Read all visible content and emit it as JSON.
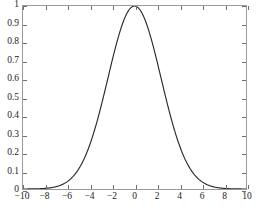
{
  "figure": {
    "caption": "",
    "background_color": "#ffffff"
  },
  "chart_data": {
    "type": "line",
    "title": "",
    "xlabel": "",
    "ylabel": "",
    "xlim": [
      -10,
      10
    ],
    "ylim": [
      0,
      1
    ],
    "grid": false,
    "legend": null,
    "line_color": "#2b2b2b",
    "frame_color": "#9a9a9a",
    "xticks": [
      -10,
      -8,
      -6,
      -4,
      -2,
      0,
      2,
      4,
      6,
      8,
      10
    ],
    "xticklabels": [
      "-10",
      "-8",
      "-6",
      "-4",
      "-2",
      "0",
      "2",
      "4",
      "6",
      "8",
      "10"
    ],
    "yticks": [
      0,
      0.1,
      0.2,
      0.3,
      0.4,
      0.5,
      0.6,
      0.7,
      0.8,
      0.9,
      1
    ],
    "yticklabels": [
      "0",
      "0.1",
      "0.2",
      "0.3",
      "0.4",
      "0.5",
      "0.6",
      "0.7",
      "0.8",
      "0.9",
      "1"
    ],
    "series": [
      {
        "name": "gaussian",
        "function": "exp(-x^2 / (2 * 2.38^2))",
        "peak_x": 0,
        "peak_y": 1,
        "sigma": 2.38,
        "x": [
          -10,
          -9.5,
          -9,
          -8.5,
          -8,
          -7.5,
          -7,
          -6.5,
          -6,
          -5.5,
          -5,
          -4.5,
          -4,
          -3.5,
          -3,
          -2.5,
          -2,
          -1.5,
          -1,
          -0.5,
          0,
          0.5,
          1,
          1.5,
          2,
          2.5,
          3,
          3.5,
          4,
          4.5,
          5,
          5.5,
          6,
          6.5,
          7,
          7.5,
          8,
          8.5,
          9,
          9.5,
          10
        ],
        "y": [
          0.0,
          0.0,
          0.001,
          0.002,
          0.004,
          0.008,
          0.016,
          0.028,
          0.048,
          0.077,
          0.115,
          0.166,
          0.228,
          0.3,
          0.38,
          0.463,
          0.546,
          0.672,
          0.74,
          0.862,
          1.0,
          0.862,
          0.74,
          0.672,
          0.546,
          0.463,
          0.38,
          0.3,
          0.228,
          0.166,
          0.115,
          0.077,
          0.048,
          0.028,
          0.016,
          0.008,
          0.004,
          0.002,
          0.001,
          0.0,
          0.0
        ]
      }
    ]
  }
}
